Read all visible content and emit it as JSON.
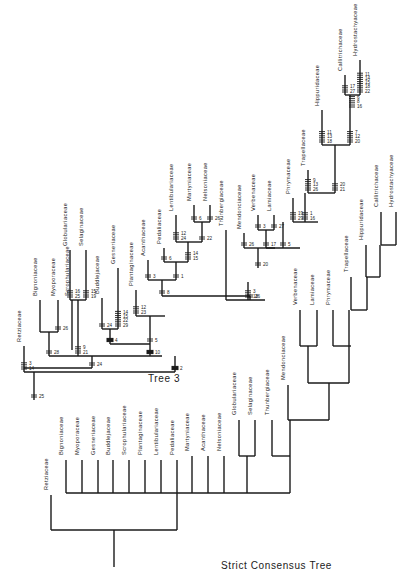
{
  "figure": {
    "tree3_label": "Tree 3",
    "consensus_label": "Strict Consensus Tree"
  },
  "tree3": {
    "taxa": [
      {
        "id": "retz",
        "name": "Retziaceae",
        "chars": [
          "14",
          "3"
        ]
      },
      {
        "id": "scro",
        "name": "Scrophulariaceae",
        "chars": []
      },
      {
        "id": "bign",
        "name": "Bignoniaceae",
        "chars": []
      },
      {
        "id": "myop",
        "name": "Myoporaceae",
        "chars": [
          "26"
        ]
      },
      {
        "id": "glob",
        "name": "Globulariaceae",
        "chars": [
          "25",
          "16"
        ]
      },
      {
        "id": "sela",
        "name": "Selaginaceae",
        "chars": [
          "19",
          "15"
        ]
      },
      {
        "id": "budd",
        "name": "Buddlejaceae",
        "chars": [
          "24"
        ]
      },
      {
        "id": "gesn",
        "name": "Gesneriaceae",
        "chars": [
          "29",
          "22",
          "15",
          "14"
        ]
      },
      {
        "id": "plan",
        "name": "Plantaginaceae",
        "chars": [
          "23",
          "12"
        ]
      },
      {
        "id": "acan",
        "name": "Acanthaceae",
        "chars": [
          "3"
        ]
      },
      {
        "id": "peda",
        "name": "Pedaliaceae",
        "chars": [
          "6"
        ]
      },
      {
        "id": "lent",
        "name": "Lentibulariaceae",
        "chars": [
          "24",
          "12"
        ]
      },
      {
        "id": "mart",
        "name": "Martyniaceae",
        "chars": [
          "6"
        ]
      },
      {
        "id": "nels",
        "name": "Nelsoniaceae",
        "chars": [
          "26"
        ]
      },
      {
        "id": "thun",
        "name": "Thunbergiaceae",
        "chars": []
      },
      {
        "id": "mend",
        "name": "Mendonciaceae",
        "chars": [
          "26"
        ]
      },
      {
        "id": "verb",
        "name": "Verbenaceae",
        "chars": [
          "3"
        ]
      },
      {
        "id": "lami",
        "name": "Lamiaceae",
        "chars": [
          "27"
        ]
      },
      {
        "id": "phry",
        "name": "Phrymaceae",
        "chars": [
          "29",
          "19"
        ]
      },
      {
        "id": "trap",
        "name": "Trapellaceae",
        "chars": [
          "26",
          "13",
          "9"
        ]
      },
      {
        "id": "hipp",
        "name": "Hippuridaceae",
        "chars": [
          "18",
          "13",
          "11"
        ]
      },
      {
        "id": "call",
        "name": "Callitrichaceae",
        "chars": [
          "27",
          "17"
        ]
      },
      {
        "id": "hydr",
        "name": "Hydrostachyaceae",
        "chars": [
          "22",
          "18",
          "15",
          "14",
          "11"
        ]
      }
    ],
    "internal_nodes": [
      {
        "id": "n_root",
        "chars": [
          "25"
        ]
      },
      {
        "id": "n_main",
        "chars": [
          "2"
        ]
      },
      {
        "id": "n_core",
        "chars": [
          "24"
        ]
      },
      {
        "id": "n_bm",
        "chars": [
          "28"
        ]
      },
      {
        "id": "n_gs",
        "chars": [
          "21",
          "9"
        ]
      },
      {
        "id": "n_bg",
        "chars": [
          "4"
        ]
      },
      {
        "id": "n_bgp",
        "chars": [
          "10"
        ]
      },
      {
        "id": "n_pl",
        "chars": [
          "5"
        ]
      },
      {
        "id": "n_upper",
        "chars": [
          "26"
        ]
      },
      {
        "id": "n_acan",
        "chars": [
          "8"
        ]
      },
      {
        "id": "n_ped",
        "chars": [
          "1"
        ]
      },
      {
        "id": "n_lmn",
        "chars": [
          "15",
          "14"
        ]
      },
      {
        "id": "n_mn",
        "chars": [
          "22"
        ]
      },
      {
        "id": "n_thun",
        "chars": [
          "18",
          "3"
        ]
      },
      {
        "id": "n_mend",
        "chars": [
          "20"
        ]
      },
      {
        "id": "n_vl",
        "chars": [
          "17"
        ]
      },
      {
        "id": "n_verb",
        "chars": [
          "5"
        ]
      },
      {
        "id": "n_phry",
        "chars": [
          "16",
          "1"
        ]
      },
      {
        "id": "n_trap",
        "chars": [
          "21",
          "20"
        ]
      },
      {
        "id": "n_hipp",
        "chars": [
          "20",
          "12",
          "7"
        ]
      },
      {
        "id": "n_ch",
        "chars": [
          "16",
          "8",
          "6"
        ]
      }
    ]
  },
  "consensus": {
    "taxa": [
      {
        "id": "c_retz",
        "name": "Retziaceae"
      },
      {
        "id": "c_bign",
        "name": "Bignoniaceae"
      },
      {
        "id": "c_myop",
        "name": "Myoporaceae"
      },
      {
        "id": "c_gesn",
        "name": "Gesneriaceae"
      },
      {
        "id": "c_budd",
        "name": "Buddlejaceae"
      },
      {
        "id": "c_scro",
        "name": "Scrophulariaceae"
      },
      {
        "id": "c_plan",
        "name": "Plantaginaceae"
      },
      {
        "id": "c_lent",
        "name": "Lentibulariaceae"
      },
      {
        "id": "c_peda",
        "name": "Pedaliaceae"
      },
      {
        "id": "c_mart",
        "name": "Martyniaceae"
      },
      {
        "id": "c_acan",
        "name": "Acanthaceae"
      },
      {
        "id": "c_nels",
        "name": "Nelsoniaceae"
      },
      {
        "id": "c_glob",
        "name": "Globulariaceae"
      },
      {
        "id": "c_sela",
        "name": "Selaginaceae"
      },
      {
        "id": "c_thun",
        "name": "Thunbergiaceae"
      },
      {
        "id": "c_mend",
        "name": "Mendonciaceae"
      },
      {
        "id": "c_verb",
        "name": "Verbenaceae"
      },
      {
        "id": "c_lami",
        "name": "Lamiaceae"
      },
      {
        "id": "c_phry",
        "name": "Phrymaceae"
      },
      {
        "id": "c_trap",
        "name": "Trapellaceae"
      },
      {
        "id": "c_hipp",
        "name": "Hippuridaceae"
      },
      {
        "id": "c_call",
        "name": "Callitrichaceae"
      },
      {
        "id": "c_hydr",
        "name": "Hydrostachyaceae"
      }
    ]
  }
}
